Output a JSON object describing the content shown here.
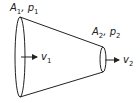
{
  "diagram": {
    "type": "converging pipe / nozzle flow",
    "inlet": {
      "area": "A",
      "area_sub": "1",
      "pressure": "p",
      "pressure_sub": "1",
      "velocity": "v",
      "velocity_sub": "1"
    },
    "outlet": {
      "area": "A",
      "area_sub": "2",
      "pressure": "p",
      "pressure_sub": "2",
      "velocity": "v",
      "velocity_sub": "2"
    },
    "separator": ", ",
    "stroke_color": "#222222"
  }
}
